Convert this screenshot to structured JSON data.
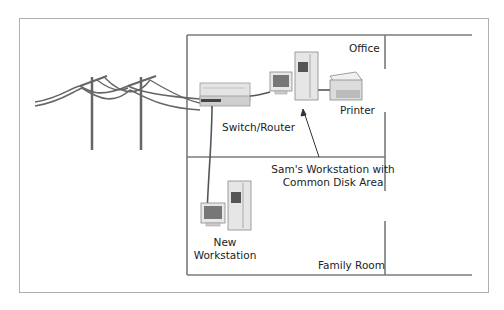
{
  "diagram": {
    "rooms": {
      "office": "Office",
      "family_room": "Family Room"
    },
    "devices": {
      "switch_router": "Switch/Router",
      "printer": "Printer",
      "sams_workstation_line1": "Sam's Workstation with",
      "sams_workstation_line2": "Common Disk Area",
      "new_workstation_line1": "New",
      "new_workstation_line2": "Workstation"
    },
    "icons": [
      "utility-pole-icon",
      "switch-router-icon",
      "monitor-icon",
      "tower-pc-icon",
      "printer-icon"
    ],
    "colors": {
      "wall": "#777777",
      "frame": "#aaaaaa",
      "cable": "#555555"
    }
  }
}
